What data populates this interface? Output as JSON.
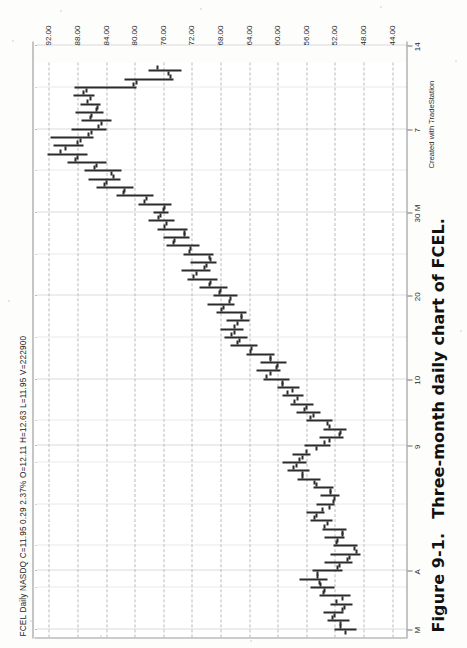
{
  "figure": {
    "number": "Figure 9-1.",
    "caption": "Three-month daily chart of FCEL."
  },
  "chart_header": {
    "quote_line": "FCEL Daily NASDQ  C=11.95  0.29  2.37%   O=12.11  H=12.63  L=11.95  V=222900",
    "symbol": "FCEL",
    "interval": "Daily",
    "exchange": "NASDQ",
    "close": "C=11.95",
    "change": "0.29",
    "change_pct": "2.37%",
    "open": "O=12.11",
    "high": "H=12.63",
    "low": "L=11.95",
    "volume": "V=222900"
  },
  "credit": "Created with TradeStation",
  "chart_data": {
    "type": "bar",
    "title": "FCEL Daily NASDQ",
    "subtitle": "Three-month daily chart of FCEL",
    "xlabel": "",
    "ylabel": "Price",
    "grid": true,
    "legend": "none",
    "orientation": "rotated-90-ccw",
    "ylim": [
      42,
      94
    ],
    "ytick_labels": [
      "92.00",
      "88.00",
      "84.00",
      "80.00",
      "76.00",
      "72.00",
      "68.00",
      "64.00",
      "60.00",
      "56.00",
      "52.00",
      "48.00",
      "44.00"
    ],
    "ytick_values": [
      92,
      88,
      84,
      80,
      76,
      72,
      68,
      64,
      60,
      56,
      52,
      48,
      44
    ],
    "xtick_labels": [
      "M",
      "A",
      "9",
      "10",
      "20",
      "30 M",
      "7",
      "14",
      "21",
      "20",
      "J"
    ],
    "xtick_positions": [
      0,
      7,
      22,
      30,
      40,
      50,
      60,
      70,
      80,
      90,
      99
    ],
    "series": [
      {
        "name": "FCEL OHLC",
        "fields": [
          "open",
          "high",
          "low",
          "close"
        ],
        "bars": [
          [
            50.5,
            52.0,
            49.0,
            51.2
          ],
          [
            51.2,
            53.0,
            50.0,
            52.4
          ],
          [
            52.0,
            53.6,
            50.8,
            51.0
          ],
          [
            50.6,
            52.6,
            49.6,
            51.8
          ],
          [
            51.0,
            54.2,
            49.8,
            53.6
          ],
          [
            53.4,
            55.4,
            52.0,
            54.0
          ],
          [
            54.2,
            57.0,
            53.0,
            54.4
          ],
          [
            54.5,
            55.2,
            51.0,
            51.6
          ],
          [
            51.4,
            53.4,
            49.6,
            50.2
          ],
          [
            50.0,
            52.6,
            48.4,
            49.0
          ],
          [
            49.2,
            52.2,
            48.8,
            51.8
          ],
          [
            51.6,
            53.4,
            50.6,
            51.0
          ],
          [
            51.0,
            53.8,
            50.4,
            53.4
          ],
          [
            53.0,
            55.4,
            52.4,
            54.8
          ],
          [
            54.6,
            56.0,
            53.4,
            53.8
          ],
          [
            52.8,
            54.6,
            52.0,
            52.2
          ],
          [
            52.0,
            54.0,
            51.4,
            52.6
          ],
          [
            52.6,
            55.0,
            52.2,
            54.6
          ],
          [
            54.8,
            57.2,
            54.0,
            56.6
          ],
          [
            56.6,
            58.6,
            55.6,
            57.8
          ],
          [
            57.4,
            59.4,
            56.0,
            57.0
          ],
          [
            56.6,
            58.0,
            55.4,
            56.0
          ],
          [
            54.6,
            56.2,
            52.6,
            53.4
          ],
          [
            52.8,
            54.2,
            50.8,
            51.4
          ],
          [
            51.2,
            53.6,
            50.4,
            52.8
          ],
          [
            53.0,
            56.0,
            52.4,
            55.4
          ],
          [
            55.0,
            57.4,
            54.0,
            56.2
          ],
          [
            56.0,
            58.2,
            55.0,
            57.6
          ],
          [
            57.2,
            59.4,
            56.4,
            58.6
          ],
          [
            58.0,
            60.0,
            57.0,
            59.4
          ],
          [
            59.4,
            62.0,
            58.4,
            61.6
          ],
          [
            61.0,
            63.0,
            59.6,
            60.2
          ],
          [
            60.0,
            62.4,
            58.8,
            61.0
          ],
          [
            61.0,
            64.4,
            60.4,
            63.8
          ],
          [
            63.6,
            66.6,
            62.8,
            65.6
          ],
          [
            65.4,
            67.4,
            64.2,
            66.4
          ],
          [
            66.0,
            68.0,
            64.8,
            66.0
          ],
          [
            65.6,
            67.2,
            64.0,
            65.0
          ],
          [
            65.0,
            68.6,
            64.4,
            67.8
          ],
          [
            67.6,
            69.8,
            66.0,
            66.8
          ],
          [
            66.6,
            69.0,
            65.6,
            68.2
          ],
          [
            68.0,
            71.0,
            67.0,
            69.6
          ],
          [
            69.4,
            72.6,
            68.4,
            71.8
          ],
          [
            71.4,
            73.4,
            69.4,
            70.2
          ],
          [
            70.0,
            72.2,
            68.6,
            69.4
          ],
          [
            69.6,
            73.2,
            69.0,
            72.4
          ],
          [
            72.2,
            75.6,
            71.0,
            74.6
          ],
          [
            74.4,
            76.0,
            72.4,
            73.0
          ],
          [
            73.0,
            76.8,
            72.6,
            75.8
          ],
          [
            75.6,
            78.0,
            74.4,
            76.6
          ],
          [
            76.4,
            77.4,
            75.2,
            76.0
          ],
          [
            75.8,
            79.4,
            74.8,
            78.6
          ],
          [
            78.4,
            82.6,
            77.4,
            81.6
          ],
          [
            81.4,
            85.4,
            80.2,
            84.2
          ],
          [
            84.0,
            86.4,
            82.0,
            83.0
          ],
          [
            83.2,
            87.0,
            81.8,
            85.6
          ],
          [
            85.4,
            89.4,
            84.0,
            88.2
          ],
          [
            88.0,
            92.2,
            86.6,
            90.4
          ],
          [
            89.6,
            91.4,
            87.2,
            88.0
          ],
          [
            87.6,
            91.8,
            85.8,
            86.4
          ],
          [
            86.0,
            88.8,
            84.0,
            85.0
          ],
          [
            84.6,
            87.4,
            83.2,
            86.2
          ],
          [
            86.0,
            88.2,
            84.4,
            85.4
          ],
          [
            85.2,
            87.6,
            84.8,
            86.6
          ],
          [
            86.2,
            88.6,
            85.6,
            87.2
          ],
          [
            86.8,
            88.4,
            79.8,
            80.2
          ],
          [
            79.8,
            81.4,
            74.6,
            75.0
          ],
          [
            75.2,
            78.0,
            73.4,
            76.8
          ]
        ]
      }
    ]
  }
}
